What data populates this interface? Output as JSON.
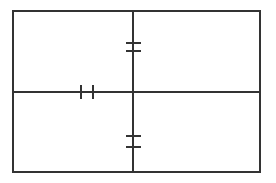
{
  "canvas": {
    "width": 276,
    "height": 183,
    "background_color": "#ffffff",
    "title": "Technical Dimension Drawing"
  },
  "style": {
    "line_color": "#333333",
    "outline_stroke_width": 2,
    "centerline_stroke_width": 2,
    "tick_stroke_width": 2
  },
  "chart_data": {
    "type": "diagram",
    "title": "",
    "geometry": {
      "rectangle": {
        "left": 13,
        "top": 11,
        "right": 260,
        "bottom": 172,
        "width": 247,
        "height": 161
      },
      "vertical_centerline": {
        "x": 133,
        "y_start": 11,
        "y_end": 172
      },
      "horizontal_centerline": {
        "y": 92,
        "x_start": 13,
        "x_end": 260
      },
      "vertical_dimension_ticks": [
        {
          "name": "upper-outer-tick",
          "y": 43,
          "x_start": 126,
          "x_end": 141,
          "orientation": "horizontal"
        },
        {
          "name": "upper-inner-tick",
          "y": 51,
          "x_start": 126,
          "x_end": 141,
          "orientation": "horizontal"
        },
        {
          "name": "lower-inner-tick",
          "y": 136,
          "x_start": 126,
          "x_end": 141,
          "orientation": "horizontal"
        },
        {
          "name": "lower-outer-tick",
          "y": 147,
          "x_start": 126,
          "x_end": 141,
          "orientation": "horizontal"
        }
      ],
      "horizontal_dimension_ticks": [
        {
          "name": "left-tick",
          "x": 81,
          "y_start": 85,
          "y_end": 99,
          "orientation": "vertical"
        },
        {
          "name": "right-tick",
          "x": 93,
          "y_start": 85,
          "y_end": 99,
          "orientation": "vertical"
        }
      ],
      "dimension_gaps": [
        {
          "name": "vertical-upper-gap",
          "axis": "vertical",
          "from": 43,
          "to": 51
        },
        {
          "name": "vertical-lower-gap",
          "axis": "vertical",
          "from": 136,
          "to": 147
        },
        {
          "name": "horizontal-center-gap",
          "axis": "horizontal",
          "from": 81,
          "to": 93
        }
      ]
    },
    "labels": []
  }
}
